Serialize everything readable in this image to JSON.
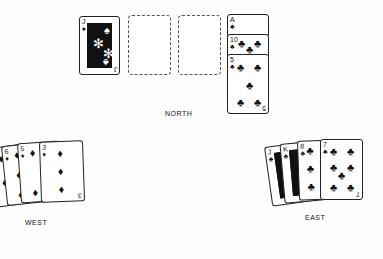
{
  "game": {
    "title": "",
    "players": {
      "north": {
        "label": "NORTH",
        "played_card": {
          "rank": "J",
          "suit": "♠",
          "face": true
        },
        "hand": [
          {
            "rank": "A",
            "suit": "♣"
          },
          {
            "rank": "10",
            "suit": "♣"
          },
          {
            "rank": "5",
            "suit": "♣"
          }
        ]
      },
      "west": {
        "label": "WEST",
        "hand": [
          {
            "rank": "",
            "suit": "♦"
          },
          {
            "rank": "6",
            "suit": "♦"
          },
          {
            "rank": "5",
            "suit": "♦"
          },
          {
            "rank": "3",
            "suit": "♦"
          }
        ]
      },
      "east": {
        "label": "EAST",
        "hand": [
          {
            "rank": "J",
            "suit": "♣",
            "face": true
          },
          {
            "rank": "K",
            "suit": "♣",
            "face": true
          },
          {
            "rank": "8",
            "suit": "♣"
          },
          {
            "rank": "7",
            "suit": "♣"
          }
        ]
      }
    },
    "trick_slots": [
      "empty",
      "empty"
    ]
  }
}
